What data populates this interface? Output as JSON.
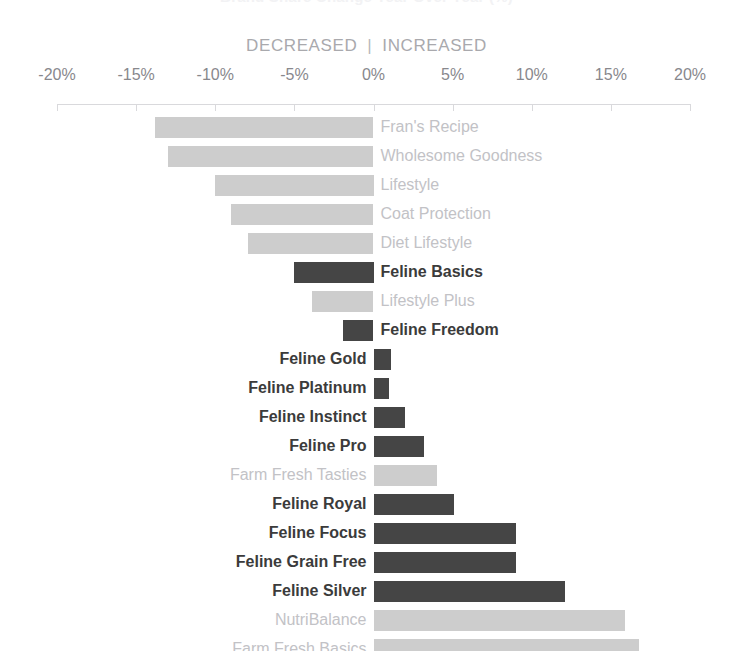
{
  "title": "Brand Share Change Year Over Year (%)",
  "header": {
    "decreased_label": "DECREASED",
    "separator": "|",
    "increased_label": "INCREASED"
  },
  "colors": {
    "bar_dark": "#454545",
    "bar_light": "#cdcdcd",
    "label_dark": "#3b3b3b",
    "label_light": "#c2c2c6",
    "axis": "#d9d9dc",
    "axis_text": "#88888d",
    "header_text": "#a9a9ad"
  },
  "chart_data": {
    "type": "bar",
    "orientation": "horizontal",
    "title": "Brand Share Change Year Over Year (%)",
    "xlabel": "",
    "ylabel": "",
    "xlim": [
      -20,
      20
    ],
    "grid": false,
    "legend": "none",
    "tick_labels": [
      "-20%",
      "-15%",
      "-10%",
      "-5%",
      "0%",
      "5%",
      "10%",
      "15%",
      "20%"
    ],
    "ticks": [
      -20,
      -15,
      -10,
      -5,
      0,
      5,
      10,
      15,
      20
    ],
    "annotations": [
      "DECREASED",
      "|",
      "INCREASED"
    ],
    "categories": [
      "Fran's Recipe",
      "Wholesome Goodness",
      "Lifestyle",
      "Coat Protection",
      "Diet Lifestyle",
      "Feline Basics",
      "Lifestyle Plus",
      "Feline Freedom",
      "Feline Gold",
      "Feline Platinum",
      "Feline Instinct",
      "Feline Pro",
      "Farm Fresh Tasties",
      "Feline Royal",
      "Feline Focus",
      "Feline Grain Free",
      "Feline Silver",
      "NutriBalance",
      "Farm Fresh Basics"
    ],
    "values": [
      -13.8,
      -13.0,
      -10.0,
      -9.0,
      -7.9,
      -5.0,
      -3.9,
      -1.9,
      1.1,
      1.0,
      2.0,
      3.2,
      4.0,
      5.1,
      9.0,
      9.0,
      12.1,
      15.9,
      16.8
    ],
    "highlighted": [
      false,
      false,
      false,
      false,
      false,
      true,
      false,
      true,
      true,
      true,
      true,
      true,
      false,
      true,
      true,
      true,
      true,
      false,
      false
    ]
  }
}
